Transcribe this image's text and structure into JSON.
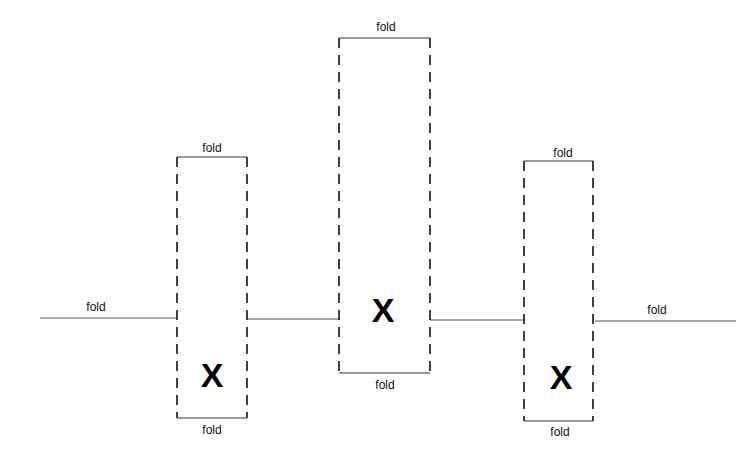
{
  "diagram": {
    "type": "fold-pattern",
    "colors": {
      "line": "#555555",
      "dash": "#111111",
      "text": "#111111"
    },
    "segments": [
      {
        "id": "left",
        "label": "fold",
        "x1": 40,
        "x2": 177,
        "y": 318
      },
      {
        "id": "mid1",
        "label": "",
        "x1": 247,
        "x2": 339,
        "y": 319
      },
      {
        "id": "mid2",
        "label": "",
        "x1": 430,
        "x2": 524,
        "y": 320
      },
      {
        "id": "right",
        "label": "fold",
        "x1": 595,
        "x2": 736,
        "y": 321
      }
    ],
    "boxes": [
      {
        "id": "box1",
        "top_label": "fold",
        "bottom_label": "fold",
        "mark": "X",
        "left": 177,
        "right": 247,
        "top": 157,
        "bottom": 418,
        "mark_y": 375
      },
      {
        "id": "box2",
        "top_label": "fold",
        "bottom_label": "fold",
        "mark": "X",
        "left": 339,
        "right": 430,
        "top": 38,
        "bottom": 373,
        "mark_y": 311
      },
      {
        "id": "box3",
        "top_label": "fold",
        "bottom_label": "fold",
        "mark": "X",
        "left": 524,
        "right": 593,
        "top": 161,
        "bottom": 421,
        "mark_y": 377
      }
    ]
  }
}
